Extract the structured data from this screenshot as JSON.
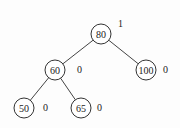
{
  "diagram": {
    "type": "binary-tree",
    "nodes": [
      {
        "id": "n80",
        "value": "80",
        "cx": 101,
        "cy": 34,
        "balance": "1",
        "bx": 118,
        "by": 27
      },
      {
        "id": "n60",
        "value": "60",
        "cx": 55,
        "cy": 70,
        "balance": "0",
        "bx": 77,
        "by": 73
      },
      {
        "id": "n100",
        "value": "100",
        "cx": 146,
        "cy": 70,
        "balance": "0",
        "bx": 163,
        "by": 73
      },
      {
        "id": "n50",
        "value": "50",
        "cx": 24,
        "cy": 108,
        "balance": "0",
        "bx": 43,
        "by": 111
      },
      {
        "id": "n65",
        "value": "65",
        "cx": 81,
        "cy": 108,
        "balance": "0",
        "bx": 97,
        "by": 111
      }
    ],
    "edges": [
      {
        "from": "n80",
        "to": "n60"
      },
      {
        "from": "n80",
        "to": "n100"
      },
      {
        "from": "n60",
        "to": "n50"
      },
      {
        "from": "n60",
        "to": "n65"
      }
    ],
    "node_radius": 10
  }
}
